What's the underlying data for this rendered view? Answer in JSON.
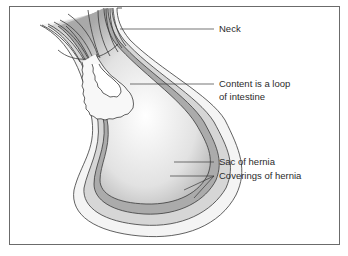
{
  "figure": {
    "labels": [
      {
        "id": "neck",
        "text": "Neck"
      },
      {
        "id": "content",
        "line1": "Content is a loop",
        "line2": "of intestine"
      },
      {
        "id": "sac",
        "text": "Sac of hernia"
      },
      {
        "id": "coverings",
        "text": "Coverings of hernia"
      }
    ]
  },
  "colors": {
    "frame": "#6b6b6b",
    "outline": "#3a3a3a",
    "outer_covering": "#f1f1f1",
    "middle_covering": "#cfcfcf",
    "sac_wall": "#a8a8a8",
    "sac_interior": "#e6e6e6",
    "intestine": "#f7f7f7",
    "label_text": "#2b2b2b"
  }
}
